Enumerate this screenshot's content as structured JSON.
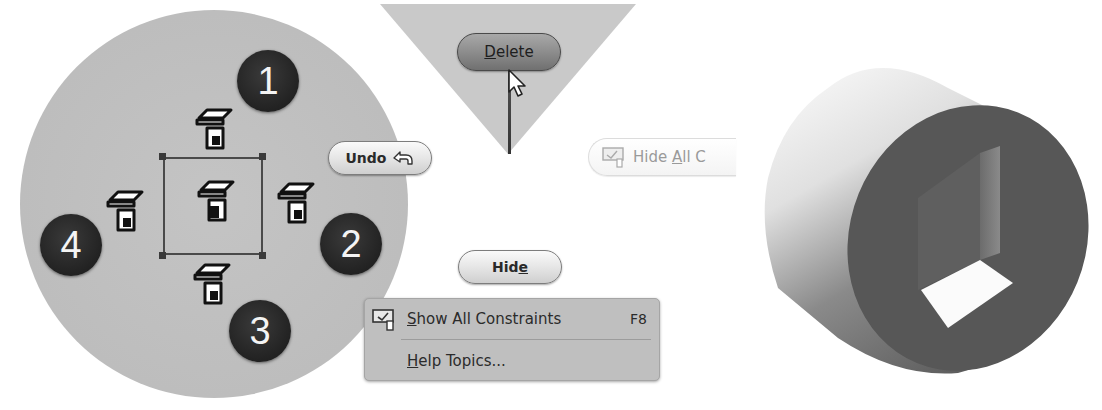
{
  "marking_menu": {
    "badges": [
      {
        "id": 1,
        "label": "1"
      },
      {
        "id": 2,
        "label": "2"
      },
      {
        "id": 3,
        "label": "3"
      },
      {
        "id": 4,
        "label": "4"
      }
    ],
    "icons": [
      "constraint-icon-top",
      "constraint-icon-right",
      "constraint-icon-bottom",
      "constraint-icon-left",
      "constraint-icon-center"
    ]
  },
  "buttons": {
    "undo": {
      "label": "Undo",
      "icon": "undo-arrow-icon"
    },
    "delete": {
      "label_pre": "",
      "label_ul": "D",
      "label_post": "elete"
    },
    "hide": {
      "label_pre": "Hid",
      "label_ul": "e",
      "label_post": ""
    },
    "hide_all": {
      "label_pre": "Hide ",
      "label_ul": "A",
      "label_post": "ll C",
      "icon": "constraint-visibility-icon"
    }
  },
  "context_menu": {
    "items": [
      {
        "label_ul": "S",
        "label_rest": "how All Constraints",
        "shortcut": "F8",
        "icon": "show-constraints-icon"
      },
      {
        "label_ul": "H",
        "label_rest": "elp Topics...",
        "shortcut": ""
      }
    ]
  },
  "colors": {
    "circle_bg": "#bdbdbd",
    "badge_bg": "#222222",
    "triangle_bg": "#c9c9c9",
    "menu_bg": "#bfbfbf",
    "cylinder_face": "#5a5a5a"
  }
}
